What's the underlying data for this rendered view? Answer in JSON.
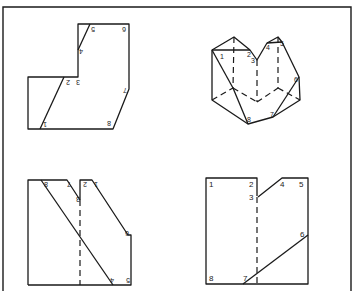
{
  "figure": {
    "panels": [
      {
        "id": "top-left",
        "type": "flat-net-rotated",
        "labels": [
          "1",
          "2",
          "3",
          "4",
          "5",
          "6",
          "7",
          "8"
        ]
      },
      {
        "id": "top-right",
        "type": "3d-polyhedron",
        "labels": [
          "1",
          "2",
          "3",
          "4",
          "5",
          "6",
          "7",
          "8"
        ]
      },
      {
        "id": "bottom-left",
        "type": "folded-net-mirrored",
        "labels": [
          "1",
          "2",
          "3",
          "4",
          "5",
          "6",
          "7",
          "8"
        ]
      },
      {
        "id": "bottom-right",
        "type": "flat-net",
        "labels": [
          "1",
          "2",
          "3",
          "4",
          "5",
          "6",
          "7",
          "8"
        ]
      }
    ]
  },
  "tl": {
    "l1": "1",
    "l2": "2",
    "l3": "3",
    "l4": "4",
    "l5": "5",
    "l6": "6",
    "l7": "7",
    "l8": "8"
  },
  "tr": {
    "l1": "1",
    "l2": "2",
    "l3": "3",
    "l4": "4",
    "l5": "5",
    "l6": "6",
    "l7": "7",
    "l8": "8"
  },
  "bl": {
    "l1": "1",
    "l2": "2",
    "l3": "3",
    "l4": "4",
    "l5": "5",
    "l6": "6",
    "l7": "7",
    "l8": "8"
  },
  "br": {
    "l1": "1",
    "l2": "2",
    "l3": "3",
    "l4": "4",
    "l5": "5",
    "l6": "6",
    "l7": "7",
    "l8": "8"
  }
}
